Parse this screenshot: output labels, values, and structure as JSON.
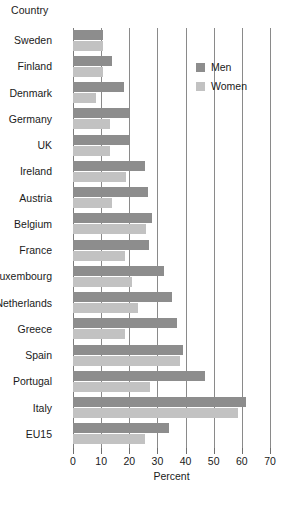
{
  "chart_data": {
    "type": "bar",
    "orientation": "horizontal",
    "title": "",
    "ylabel": "Country",
    "xlabel": "Percent",
    "xlim": [
      0,
      70
    ],
    "xticks": [
      0,
      10,
      20,
      30,
      40,
      50,
      60,
      70
    ],
    "grid": true,
    "legend_position": "top-right",
    "categories": [
      "Sweden",
      "Finland",
      "Denmark",
      "Germany",
      "UK",
      "Ireland",
      "Austria",
      "Belgium",
      "France",
      "Luxembourg",
      "Netherlands",
      "Greece",
      "Spain",
      "Portugal",
      "Italy",
      "EU15"
    ],
    "series": [
      {
        "name": "Men",
        "color": "#8d8d8d",
        "values": [
          10.5,
          14,
          18,
          20,
          20,
          25.5,
          26.5,
          28,
          27,
          32.5,
          35,
          37,
          39,
          47,
          61.5,
          34
        ]
      },
      {
        "name": "Women",
        "color": "#c2c2c2",
        "values": [
          10.5,
          10.5,
          8,
          13,
          13,
          19,
          14,
          26,
          18.5,
          21,
          23,
          18.5,
          38,
          27.5,
          58.5,
          25.5
        ]
      }
    ]
  },
  "legend": {
    "entries": [
      {
        "label": "Men",
        "swatch": "men"
      },
      {
        "label": "Women",
        "swatch": "women"
      }
    ]
  }
}
